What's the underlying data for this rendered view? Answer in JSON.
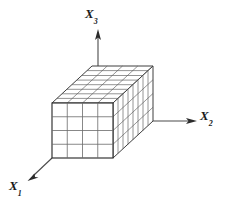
{
  "figure": {
    "kind": "3d-cuboid-grid-diagram",
    "background_color": "#ffffff",
    "line_color": "#4a4a4a",
    "label_color": "#1a1a1a",
    "axes": [
      {
        "id": "x1",
        "label_base": "X",
        "label_sub": "1",
        "direction": "down-left"
      },
      {
        "id": "x2",
        "label_base": "X",
        "label_sub": "2",
        "direction": "right"
      },
      {
        "id": "x3",
        "label_base": "X",
        "label_sub": "3",
        "direction": "up"
      }
    ],
    "box": {
      "front_face_columns": 4,
      "front_face_rows": 4,
      "depth_divisions": 8,
      "origin_x": 52,
      "origin_y": 158,
      "width": 61,
      "height": 55,
      "depth_dx": 40,
      "depth_dy": -37
    }
  }
}
